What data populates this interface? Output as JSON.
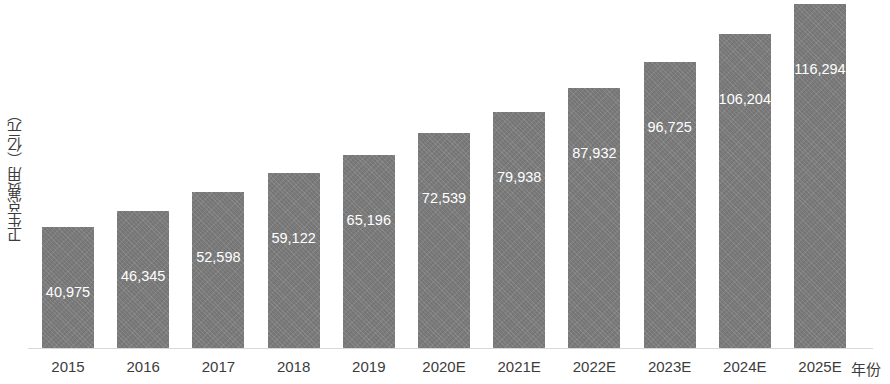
{
  "chart_data": {
    "type": "bar",
    "title": "",
    "subtitle": "",
    "xlabel": "年份",
    "ylabel": "卫生总费用（亿元）",
    "categories": [
      "2015",
      "2016",
      "2017",
      "2018",
      "2019",
      "2020E",
      "2021E",
      "2022E",
      "2023E",
      "2024E",
      "2025E"
    ],
    "values": [
      40975,
      46345,
      52598,
      59122,
      65196,
      72539,
      79938,
      87932,
      96725,
      106204,
      116294
    ],
    "value_labels": [
      "40,975",
      "46,345",
      "52,598",
      "59,122",
      "65,196",
      "72,539",
      "79,938",
      "87,932",
      "96,725",
      "106,204",
      "116,294"
    ],
    "series": [
      {
        "name": "卫生总费用（亿元）",
        "values": [
          40975,
          46345,
          52598,
          59122,
          65196,
          72539,
          79938,
          87932,
          96725,
          106204,
          116294
        ]
      }
    ],
    "ylim": [
      0,
      118000
    ],
    "grid": false,
    "legend": false,
    "legend_position": "none",
    "bar_color": "#808080",
    "label_color": "#ffffff",
    "axis_text_color": "#3c3c3c",
    "baseline_color": "#d8d8d8",
    "label_placement": "inside-bar-upper",
    "annotations": []
  }
}
